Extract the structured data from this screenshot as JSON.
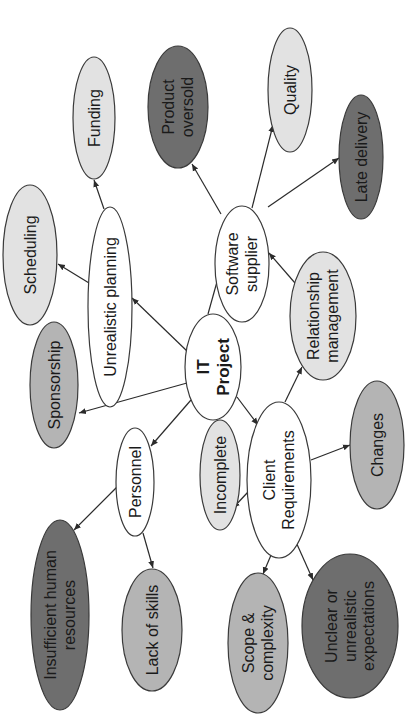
{
  "diagram": {
    "colors": {
      "white": "#ffffff",
      "light": "#e2e2e2",
      "medium": "#b4b4b4",
      "dark": "#6e6e6e",
      "stroke": "#3a3a3a",
      "text": "#1a1a1a"
    },
    "text_rotation_deg": -90,
    "nodes": [
      {
        "id": "it-project",
        "lines": [
          "IT",
          "Project"
        ],
        "bold": true,
        "fill": "white",
        "cx": 213,
        "cy": 367,
        "rx": 28,
        "ry": 53,
        "size": 17
      },
      {
        "id": "unrealistic-planning",
        "lines": [
          "Unrealistic planning"
        ],
        "fill": "white",
        "cx": 110,
        "cy": 307,
        "rx": 22,
        "ry": 100,
        "size": 16
      },
      {
        "id": "software-supplier",
        "lines": [
          "Software",
          "supplier"
        ],
        "fill": "white",
        "cx": 242,
        "cy": 264,
        "rx": 27,
        "ry": 58,
        "size": 16
      },
      {
        "id": "personnel",
        "lines": [
          "Personnel"
        ],
        "fill": "white",
        "cx": 135,
        "cy": 482,
        "rx": 19,
        "ry": 54,
        "size": 16
      },
      {
        "id": "client-requirements",
        "lines": [
          "Client",
          "Requirements"
        ],
        "fill": "white",
        "cx": 279,
        "cy": 480,
        "rx": 32,
        "ry": 78,
        "size": 16
      },
      {
        "id": "funding",
        "lines": [
          "Funding"
        ],
        "fill": "light",
        "cx": 94,
        "cy": 118,
        "rx": 21,
        "ry": 61,
        "size": 16
      },
      {
        "id": "product-oversold",
        "lines": [
          "Product",
          "oversold"
        ],
        "fill": "dark",
        "cx": 178,
        "cy": 107,
        "rx": 30,
        "ry": 61,
        "size": 16
      },
      {
        "id": "quality",
        "lines": [
          "Quality"
        ],
        "fill": "light",
        "cx": 290,
        "cy": 90,
        "rx": 22,
        "ry": 62,
        "size": 16
      },
      {
        "id": "late-delivery",
        "lines": [
          "Late delivery"
        ],
        "fill": "dark",
        "cx": 361,
        "cy": 157,
        "rx": 22,
        "ry": 62,
        "size": 16
      },
      {
        "id": "scheduling",
        "lines": [
          "Scheduling"
        ],
        "fill": "light",
        "cx": 30,
        "cy": 255,
        "rx": 27,
        "ry": 70,
        "size": 16
      },
      {
        "id": "relationship-management",
        "lines": [
          "Relationship",
          "management"
        ],
        "fill": "light",
        "cx": 323,
        "cy": 316,
        "rx": 33,
        "ry": 64,
        "size": 16
      },
      {
        "id": "sponsorship",
        "lines": [
          "Sponsorship"
        ],
        "fill": "medium",
        "cx": 54,
        "cy": 385,
        "rx": 24,
        "ry": 63,
        "size": 16
      },
      {
        "id": "incomplete",
        "lines": [
          "Incomplete"
        ],
        "fill": "light",
        "cx": 220,
        "cy": 475,
        "rx": 20,
        "ry": 55,
        "size": 16
      },
      {
        "id": "changes",
        "lines": [
          "Changes"
        ],
        "fill": "medium",
        "cx": 377,
        "cy": 445,
        "rx": 27,
        "ry": 64,
        "size": 16
      },
      {
        "id": "insufficient-human-resources",
        "lines": [
          "Insufficient human",
          "resources"
        ],
        "fill": "dark",
        "cx": 60,
        "cy": 615,
        "rx": 29,
        "ry": 95,
        "size": 16
      },
      {
        "id": "lack-of-skills",
        "lines": [
          "Lack of skills"
        ],
        "fill": "medium",
        "cx": 152,
        "cy": 630,
        "rx": 30,
        "ry": 61,
        "size": 16
      },
      {
        "id": "scope-complexity",
        "lines": [
          "Scope &",
          "complexity"
        ],
        "fill": "medium",
        "cx": 258,
        "cy": 643,
        "rx": 30,
        "ry": 70,
        "size": 16
      },
      {
        "id": "unclear-expectations",
        "lines": [
          "Unclear or",
          "unrealistic",
          "expectations"
        ],
        "fill": "dark",
        "cx": 350,
        "cy": 626,
        "rx": 48,
        "ry": 72,
        "size": 16
      }
    ],
    "edges": [
      {
        "from": "it-project",
        "to": "unrealistic-planning",
        "x1": 188,
        "y1": 352,
        "x2": 132,
        "y2": 298
      },
      {
        "from": "it-project",
        "to": "software-supplier",
        "x1": 208,
        "y1": 314,
        "x2": 220,
        "y2": 271
      },
      {
        "from": "it-project",
        "to": "sponsorship",
        "x1": 187,
        "y1": 383,
        "x2": 79,
        "y2": 413
      },
      {
        "from": "it-project",
        "to": "personnel",
        "x1": 191,
        "y1": 400,
        "x2": 151,
        "y2": 446
      },
      {
        "from": "it-project",
        "to": "client-requirements",
        "x1": 237,
        "y1": 397,
        "x2": 258,
        "y2": 425
      },
      {
        "from": "unrealistic-planning",
        "to": "scheduling",
        "x1": 89,
        "y1": 283,
        "x2": 58,
        "y2": 264
      },
      {
        "from": "unrealistic-planning",
        "to": "funding",
        "x1": 104,
        "y1": 209,
        "x2": 94,
        "y2": 180
      },
      {
        "from": "software-supplier",
        "to": "product-oversold",
        "x1": 221,
        "y1": 214,
        "x2": 192,
        "y2": 164
      },
      {
        "from": "software-supplier",
        "to": "quality",
        "x1": 252,
        "y1": 208,
        "x2": 273,
        "y2": 125
      },
      {
        "from": "software-supplier",
        "to": "late-delivery",
        "x1": 268,
        "y1": 207,
        "x2": 339,
        "y2": 158
      },
      {
        "from": "relationship-management",
        "to": "software-supplier",
        "x1": 295,
        "y1": 283,
        "x2": 269,
        "y2": 253
      },
      {
        "from": "client-requirements",
        "to": "relationship-management",
        "x1": 285,
        "y1": 402,
        "x2": 302,
        "y2": 367
      },
      {
        "from": "client-requirements",
        "to": "incomplete",
        "x1": 248,
        "y1": 492,
        "x2": 233,
        "y2": 508
      },
      {
        "from": "client-requirements",
        "to": "changes",
        "x1": 311,
        "y1": 460,
        "x2": 350,
        "y2": 445
      },
      {
        "from": "client-requirements",
        "to": "scope-complexity",
        "x1": 274,
        "y1": 548,
        "x2": 263,
        "y2": 574
      },
      {
        "from": "client-requirements",
        "to": "unclear-expectations",
        "x1": 296,
        "y1": 542,
        "x2": 313,
        "y2": 580
      },
      {
        "from": "personnel",
        "to": "insufficient-human-resources",
        "x1": 117,
        "y1": 487,
        "x2": 74,
        "y2": 530
      },
      {
        "from": "personnel",
        "to": "lack-of-skills",
        "x1": 143,
        "y1": 533,
        "x2": 153,
        "y2": 568
      }
    ]
  }
}
